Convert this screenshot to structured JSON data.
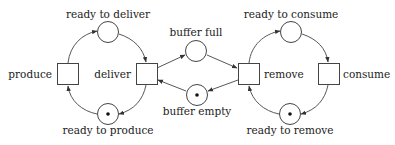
{
  "diagram": {
    "type": "petri-net",
    "places": [
      {
        "id": "ready_to_deliver",
        "label": "ready to deliver",
        "tokens": 0
      },
      {
        "id": "ready_to_produce",
        "label": "ready to produce",
        "tokens": 1
      },
      {
        "id": "buffer_full",
        "label": "buffer full",
        "tokens": 0
      },
      {
        "id": "buffer_empty",
        "label": "buffer empty",
        "tokens": 1
      },
      {
        "id": "ready_to_consume",
        "label": "ready to consume",
        "tokens": 0
      },
      {
        "id": "ready_to_remove",
        "label": "ready to remove",
        "tokens": 1
      }
    ],
    "transitions": [
      {
        "id": "produce",
        "label": "produce"
      },
      {
        "id": "deliver",
        "label": "deliver"
      },
      {
        "id": "remove",
        "label": "remove"
      },
      {
        "id": "consume",
        "label": "consume"
      }
    ],
    "arcs": [
      [
        "produce",
        "ready_to_deliver"
      ],
      [
        "ready_to_deliver",
        "deliver"
      ],
      [
        "deliver",
        "ready_to_produce"
      ],
      [
        "ready_to_produce",
        "produce"
      ],
      [
        "deliver",
        "buffer_full"
      ],
      [
        "buffer_full",
        "remove"
      ],
      [
        "remove",
        "buffer_empty"
      ],
      [
        "buffer_empty",
        "deliver"
      ],
      [
        "remove",
        "ready_to_consume"
      ],
      [
        "ready_to_consume",
        "consume"
      ],
      [
        "consume",
        "ready_to_remove"
      ],
      [
        "ready_to_remove",
        "remove"
      ]
    ]
  }
}
